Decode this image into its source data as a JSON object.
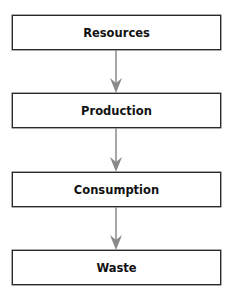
{
  "diagram": {
    "type": "vertical flowchart",
    "nodes": [
      {
        "id": "resources",
        "label": "Resources"
      },
      {
        "id": "production",
        "label": "Production"
      },
      {
        "id": "consumption",
        "label": "Consumption"
      },
      {
        "id": "waste",
        "label": "Waste"
      }
    ],
    "edges": [
      {
        "from": "resources",
        "to": "production"
      },
      {
        "from": "production",
        "to": "consumption"
      },
      {
        "from": "consumption",
        "to": "waste"
      }
    ],
    "colors": {
      "box_border": "#2a2a2a",
      "arrow": "#8a8a8a",
      "text": "#111111",
      "background": "#ffffff"
    }
  }
}
